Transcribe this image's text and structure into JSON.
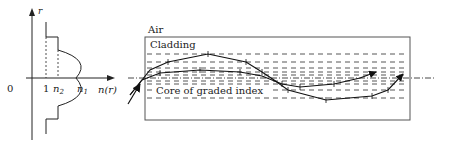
{
  "profile": {
    "axis_r_label": "r",
    "axis_n_label": "n(r)",
    "origin_label": "0",
    "tick_one_label": "1",
    "n2_label": "n",
    "n2_sub": "2",
    "n1_label": "n",
    "n1_sub": "1"
  },
  "fiber": {
    "air_label": "Air",
    "cladding_label": "Cladding",
    "core_label": "Core of graded index"
  },
  "colors": {
    "line": "#222222",
    "box": "#555555",
    "dash": "#444444"
  }
}
